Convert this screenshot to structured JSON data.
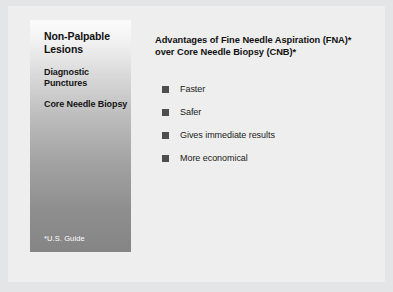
{
  "slide": {
    "background_color": "#eeeeee",
    "outer_background_color": "#e4e5e6",
    "side_panel": {
      "heading": "Non-Palpable Lesions",
      "subheading_1": "Diagnostic Punctures",
      "subheading_2": "Core Needle Biopsy",
      "footnote": "*U.S. Guide",
      "gradient_top_color": "#fbfbfb",
      "gradient_bottom_color": "#858585",
      "footnote_color": "#ffffff"
    },
    "content": {
      "heading": "Advantages of Fine Needle Aspiration (FNA)* over Core Needle Biopsy (CNB)*",
      "bullet_marker_color": "#4e4e4e",
      "bullets": [
        {
          "label": "Faster"
        },
        {
          "label": "Safer"
        },
        {
          "label": "Gives immediate results"
        },
        {
          "label": "More economical"
        }
      ]
    }
  }
}
